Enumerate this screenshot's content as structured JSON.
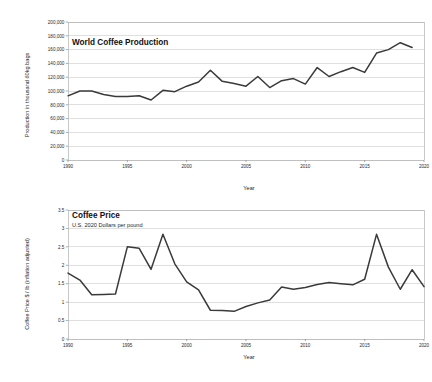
{
  "figure": {
    "background": "#ffffff",
    "line_color": "#3a3a3a",
    "grid_color": "#c9c9c9"
  },
  "chart_data": [
    {
      "id": "world-coffee-production",
      "type": "line",
      "title": "World Coffee Production",
      "subtitle": "",
      "xlabel": "Year",
      "ylabel": "Production in thousand 60kg bags",
      "xlim": [
        1990,
        2020
      ],
      "ylim": [
        0,
        200000
      ],
      "xticks": [
        1990,
        1995,
        2000,
        2005,
        2010,
        2015,
        2020
      ],
      "xticklabels": [
        "1990",
        "1995",
        "2000",
        "2005",
        "2010",
        "2015",
        "2020"
      ],
      "yticks": [
        0,
        20000,
        40000,
        60000,
        80000,
        100000,
        120000,
        140000,
        160000,
        180000,
        200000
      ],
      "yticklabels": [
        "0",
        "20,000",
        "40,000",
        "60,000",
        "80,000",
        "100,000",
        "120,000",
        "140,000",
        "160,000",
        "180,000",
        "200,000"
      ],
      "grid": true,
      "legend": "none",
      "x": [
        1990,
        1991,
        1992,
        1993,
        1994,
        1995,
        1996,
        1997,
        1998,
        1999,
        2000,
        2001,
        2002,
        2003,
        2004,
        2005,
        2006,
        2007,
        2008,
        2009,
        2010,
        2011,
        2012,
        2013,
        2014,
        2015,
        2016,
        2017,
        2018,
        2019
      ],
      "values": [
        93000,
        100000,
        100000,
        95000,
        92000,
        92000,
        93000,
        87000,
        101000,
        99000,
        107000,
        113000,
        130000,
        114000,
        111000,
        107000,
        121000,
        105000,
        115000,
        118000,
        110000,
        134000,
        121000,
        128000,
        134000,
        127000,
        138000,
        140000,
        145000,
        148000
      ]
    },
    {
      "id": "coffee-price",
      "type": "line",
      "title": "Coffee Price",
      "subtitle": "U.S. 2020 Dollars per pound",
      "xlabel": "Year",
      "ylabel": "Coffee Price $ / lb (inflation adjusted)",
      "xlim": [
        1990,
        2020
      ],
      "ylim": [
        0,
        3.5
      ],
      "xticks": [
        1990,
        1995,
        2000,
        2005,
        2010,
        2015,
        2020
      ],
      "xticklabels": [
        "1990",
        "1995",
        "2000",
        "2005",
        "2010",
        "2015",
        "2020"
      ],
      "yticks": [
        0,
        0.5,
        1,
        1.5,
        2,
        2.5,
        3,
        3.5
      ],
      "yticklabels": [
        "0",
        "0.5",
        "1",
        "1.5",
        "2",
        "2.5",
        "3",
        "3.5"
      ],
      "grid": true,
      "legend": "none",
      "x": [
        1990,
        1991,
        1992,
        1993,
        1994,
        1995,
        1996,
        1997,
        1998,
        1999,
        2000,
        2001,
        2002,
        2003,
        2004,
        2005,
        2006,
        2007,
        2008,
        2009,
        2010,
        2011,
        2012,
        2013,
        2014,
        2015,
        2016,
        2017,
        2018,
        2019,
        2020
      ],
      "values": [
        1.79,
        1.6,
        1.2,
        1.21,
        1.22,
        2.5,
        2.46,
        1.89,
        2.84,
        2.04,
        1.55,
        1.33,
        0.78,
        0.77,
        0.75,
        0.88,
        0.98,
        1.06,
        1.41,
        1.35,
        1.4,
        1.48,
        1.53,
        1.5,
        1.47,
        1.62,
        2.84,
        1.95,
        1.35,
        1.88,
        1.42
      ]
    }
  ],
  "production_series_tail": {
    "note": "values continue to 2019 peak then decline",
    "x": [
      2016,
      2017,
      2018,
      2019
    ],
    "values": [
      155000,
      160000,
      170000,
      163000
    ]
  }
}
